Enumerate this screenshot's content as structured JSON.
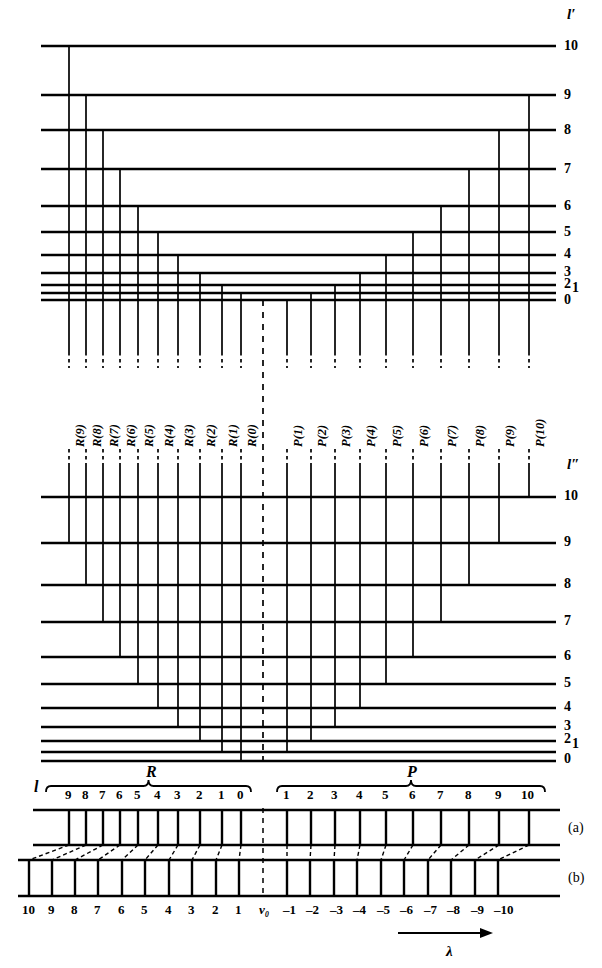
{
  "figure": {
    "upper_axis_label": "l′",
    "lower_axis_label": "l″",
    "bottom_axis_label": "l",
    "wavelength_label": "λ",
    "band_origin_label": "ν₀",
    "branch_R_label": "R",
    "branch_P_label": "P",
    "row_a_label": "(a)",
    "row_b_label": "(b)",
    "line_color": "#000000",
    "background_color": "#ffffff"
  },
  "upper_levels": {
    "axis_label": "l′",
    "numbers": [
      "10",
      "9",
      "8",
      "7",
      "6",
      "5",
      "4",
      "3",
      "2",
      "1",
      "0"
    ],
    "y": [
      46,
      95,
      130,
      169,
      206,
      232,
      255,
      273,
      285,
      293,
      300
    ],
    "x_start": 41,
    "x_end": 556
  },
  "lower_levels": {
    "axis_label": "l″",
    "numbers": [
      "10",
      "9",
      "8",
      "7",
      "6",
      "5",
      "4",
      "3",
      "2",
      "1",
      "0"
    ],
    "y": [
      497,
      543,
      585,
      622,
      657,
      684,
      708,
      727,
      741,
      752,
      761
    ],
    "x_start": 41,
    "x_end": 556
  },
  "transitions": {
    "R_branch": [
      {
        "label": "R(9)",
        "x": 69,
        "upper": 10,
        "lower": 9
      },
      {
        "label": "R(8)",
        "x": 86,
        "upper": 9,
        "lower": 8
      },
      {
        "label": "R(7)",
        "x": 103,
        "upper": 8,
        "lower": 7
      },
      {
        "label": "R(6)",
        "x": 120,
        "upper": 7,
        "lower": 6
      },
      {
        "label": "R(5)",
        "x": 138,
        "upper": 6,
        "lower": 5
      },
      {
        "label": "R(4)",
        "x": 158,
        "upper": 5,
        "lower": 4
      },
      {
        "label": "R(3)",
        "x": 178,
        "upper": 4,
        "lower": 3
      },
      {
        "label": "R(2)",
        "x": 200,
        "upper": 3,
        "lower": 2
      },
      {
        "label": "R(1)",
        "x": 222,
        "upper": 2,
        "lower": 1
      },
      {
        "label": "R(0)",
        "x": 241,
        "upper": 1,
        "lower": 0
      }
    ],
    "P_branch": [
      {
        "label": "P(1)",
        "x": 287,
        "upper": 0,
        "lower": 1
      },
      {
        "label": "P(2)",
        "x": 311,
        "upper": 1,
        "lower": 2
      },
      {
        "label": "P(3)",
        "x": 335,
        "upper": 2,
        "lower": 3
      },
      {
        "label": "P(4)",
        "x": 360,
        "upper": 3,
        "lower": 4
      },
      {
        "label": "P(5)",
        "x": 386,
        "upper": 4,
        "lower": 5
      },
      {
        "label": "P(6)",
        "x": 413,
        "upper": 5,
        "lower": 6
      },
      {
        "label": "P(7)",
        "x": 441,
        "upper": 6,
        "lower": 7
      },
      {
        "label": "P(8)",
        "x": 469,
        "upper": 7,
        "lower": 8
      },
      {
        "label": "P(9)",
        "x": 499,
        "upper": 8,
        "lower": 9
      },
      {
        "label": "P(10)",
        "x": 529,
        "upper": 9,
        "lower": 10
      }
    ],
    "band_origin_x": 263
  },
  "spectrum": {
    "row_a": {
      "label": "(a)",
      "top_y": 810,
      "bottom_y": 845,
      "x_start": 33,
      "x_end": 560,
      "R_ticks": [
        {
          "number": "9",
          "x": 69
        },
        {
          "number": "8",
          "x": 86
        },
        {
          "number": "7",
          "x": 103
        },
        {
          "number": "6",
          "x": 120
        },
        {
          "number": "5",
          "x": 138
        },
        {
          "number": "4",
          "x": 158
        },
        {
          "number": "3",
          "x": 178
        },
        {
          "number": "2",
          "x": 200
        },
        {
          "number": "1",
          "x": 222
        },
        {
          "number": "0",
          "x": 241
        }
      ],
      "P_ticks": [
        {
          "number": "1",
          "x": 287
        },
        {
          "number": "2",
          "x": 311
        },
        {
          "number": "3",
          "x": 335
        },
        {
          "number": "4",
          "x": 360
        },
        {
          "number": "5",
          "x": 386
        },
        {
          "number": "6",
          "x": 413
        },
        {
          "number": "7",
          "x": 441
        },
        {
          "number": "8",
          "x": 469
        },
        {
          "number": "9",
          "x": 499
        },
        {
          "number": "10",
          "x": 529
        }
      ]
    },
    "row_b": {
      "label": "(b)",
      "top_y": 860,
      "bottom_y": 896,
      "x_start": 18,
      "x_end": 560,
      "ticks": [
        {
          "number": "10",
          "x": 29
        },
        {
          "number": "9",
          "x": 52
        },
        {
          "number": "8",
          "x": 75
        },
        {
          "number": "7",
          "x": 98
        },
        {
          "number": "6",
          "x": 122
        },
        {
          "number": "5",
          "x": 145
        },
        {
          "number": "4",
          "x": 169
        },
        {
          "number": "3",
          "x": 192
        },
        {
          "number": "2",
          "x": 216
        },
        {
          "number": "1",
          "x": 239
        },
        {
          "number": "-1",
          "x": 287
        },
        {
          "number": "-2",
          "x": 310
        },
        {
          "number": "-3",
          "x": 334
        },
        {
          "number": "-4",
          "x": 357
        },
        {
          "number": "-5",
          "x": 381
        },
        {
          "number": "-6",
          "x": 404
        },
        {
          "number": "-7",
          "x": 428
        },
        {
          "number": "-8",
          "x": 451
        },
        {
          "number": "-9",
          "x": 475
        },
        {
          "number": "-10",
          "x": 498
        }
      ]
    },
    "bottom_numbers": [
      "10",
      "9",
      "8",
      "7",
      "6",
      "5",
      "4",
      "3",
      "2",
      "1",
      "ν₀",
      "–1",
      "–2",
      "–3",
      "–4",
      "–5",
      "–6",
      "–7",
      "–8",
      "–9",
      "–10"
    ],
    "braces": {
      "R": {
        "label": "R",
        "x_start": 46,
        "x_end": 251,
        "label_x": 150
      },
      "P": {
        "label": "P",
        "x_start": 277,
        "x_end": 545,
        "label_x": 411
      }
    },
    "l_label": {
      "text": "l",
      "x": 34,
      "y": 787
    }
  }
}
